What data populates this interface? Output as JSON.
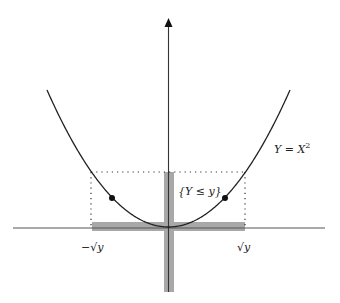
{
  "diagram": {
    "type": "function-preimage-illustration",
    "curve": {
      "equation": "Y = X²",
      "label_main": "Y = X",
      "label_exp": "2",
      "function": "x^2"
    },
    "event_label": "{Y ≤ y}",
    "x_ticks": {
      "left": "−√y",
      "right": "√y"
    },
    "colors": {
      "curve": "#222222",
      "axis": "#333333",
      "shade": "#a8a8a8",
      "dotted": "#333333"
    },
    "annotations": {
      "vertical_band": "set {Y ≤ y} on the Y axis",
      "horizontal_band": "interval [−√y, √y] on the X axis",
      "points": "two marked points on curve"
    }
  }
}
